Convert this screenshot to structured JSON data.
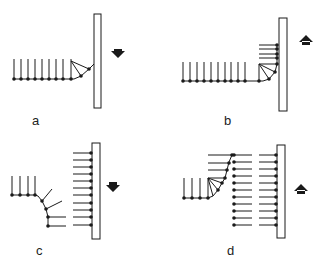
{
  "figure": {
    "panels": [
      {
        "id": "a",
        "label": "a",
        "arrow_direction": "down"
      },
      {
        "id": "b",
        "label": "b",
        "arrow_direction": "up"
      },
      {
        "id": "c",
        "label": "c",
        "arrow_direction": "down"
      },
      {
        "id": "d",
        "label": "d",
        "arrow_direction": "up"
      }
    ],
    "colors": {
      "ink": "#1a1a1a",
      "background": "#ffffff"
    }
  }
}
